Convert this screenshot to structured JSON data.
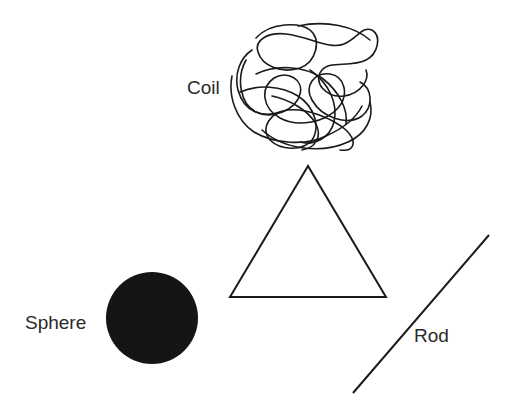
{
  "diagram": {
    "shapes": [
      {
        "id": "coil",
        "label": "Coil",
        "kind": "tangled-line"
      },
      {
        "id": "triangle",
        "label": "",
        "kind": "triangle-outline"
      },
      {
        "id": "sphere",
        "label": "Sphere",
        "kind": "filled-circle"
      },
      {
        "id": "rod",
        "label": "Rod",
        "kind": "straight-line"
      }
    ],
    "labels": {
      "coil": "Coil",
      "sphere": "Sphere",
      "rod": "Rod"
    },
    "colors": {
      "stroke": "#1a1a1a",
      "fill": "#151515",
      "background": "#ffffff"
    }
  }
}
